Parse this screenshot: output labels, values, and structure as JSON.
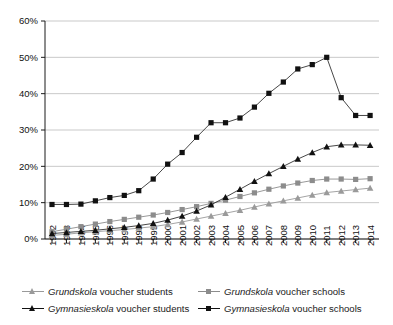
{
  "chart_data": {
    "type": "line",
    "title": "",
    "xlabel": "",
    "ylabel": "",
    "grid": true,
    "legend_position": "bottom",
    "ylim": [
      0,
      60
    ],
    "ytick_step": 10,
    "ytick_labels": [
      "0%",
      "10%",
      "20%",
      "30%",
      "40%",
      "50%",
      "60%"
    ],
    "ytick_values": [
      0,
      10,
      20,
      30,
      40,
      50,
      60
    ],
    "categories": [
      "1992",
      "1993",
      "1994",
      "1995",
      "1996",
      "1997",
      "1998",
      "1999",
      "2000",
      "2001",
      "2002",
      "2003",
      "2004",
      "2005",
      "2006",
      "2007",
      "2008",
      "2009",
      "2010",
      "2011",
      "2012",
      "2013",
      "2014"
    ],
    "series": [
      {
        "name": "Grundskola voucher students",
        "name_italic": "Grundskola",
        "name_rest": " voucher students",
        "marker": "triangle",
        "color": "#9a9a9a",
        "line_color": "#9a9a9a",
        "values": [
          1.0,
          1.3,
          1.7,
          2.0,
          2.3,
          2.6,
          3.0,
          3.4,
          4.0,
          4.7,
          5.5,
          6.3,
          7.1,
          7.9,
          8.8,
          9.7,
          10.5,
          11.3,
          12.1,
          12.8,
          13.2,
          13.6,
          14.0
        ]
      },
      {
        "name": "Grundskola voucher schools",
        "name_italic": "Grundskola",
        "name_rest": " voucher schools",
        "marker": "square",
        "color": "#8c8c8c",
        "line_color": "#8c8c8c",
        "values": [
          2.0,
          2.7,
          3.4,
          4.1,
          4.8,
          5.4,
          6.0,
          6.6,
          7.3,
          8.1,
          8.9,
          9.8,
          10.7,
          11.7,
          12.7,
          13.7,
          14.6,
          15.4,
          16.1,
          16.5,
          16.5,
          16.4,
          16.6
        ]
      },
      {
        "name": "Gymnasieskola voucher students",
        "name_italic": "Gymnasieskola",
        "name_rest": " voucher students",
        "marker": "triangle",
        "color": "#111111",
        "line_color": "#333333",
        "values": [
          1.5,
          1.8,
          2.1,
          2.4,
          2.8,
          3.2,
          3.7,
          4.3,
          5.2,
          6.3,
          7.7,
          9.4,
          11.5,
          13.7,
          15.9,
          18.0,
          20.0,
          22.0,
          23.8,
          25.4,
          25.9,
          25.9,
          25.8
        ]
      },
      {
        "name": "Gymnasieskola voucher schools",
        "name_italic": "Gymnasieskola",
        "name_rest": " voucher schools",
        "marker": "square",
        "color": "#111111",
        "line_color": "#333333",
        "values": [
          9.5,
          9.5,
          9.6,
          10.5,
          11.4,
          12.0,
          13.3,
          16.5,
          20.6,
          23.8,
          28.0,
          32.0,
          32.0,
          33.3,
          36.3,
          40.1,
          43.2,
          46.8,
          48.0,
          50.0,
          38.9,
          34.0,
          34.0
        ]
      }
    ]
  },
  "axis": {
    "y_tick_labels": [
      "60%",
      "50%",
      "40%",
      "30%",
      "20%",
      "10%",
      "0%"
    ],
    "x_tick_labels": [
      "1992",
      "1993",
      "1994",
      "1995",
      "1996",
      "1997",
      "1998",
      "1999",
      "2000",
      "2001",
      "2002",
      "2003",
      "2004",
      "2005",
      "2006",
      "2007",
      "2008",
      "2009",
      "2010",
      "2011",
      "2012",
      "2013",
      "2014"
    ]
  },
  "legend": {
    "items": [
      {
        "label": "Grundskola voucher students",
        "italic_part": "Grundskola",
        "rest_part": " voucher students",
        "marker": "triangle",
        "color": "#9a9a9a"
      },
      {
        "label": "Grundskola voucher schools",
        "italic_part": "Grundskola",
        "rest_part": " voucher schools",
        "marker": "square",
        "color": "#8c8c8c"
      },
      {
        "label": "Gymnasieskola voucher students",
        "italic_part": "Gymnasieskola",
        "rest_part": " voucher students",
        "marker": "triangle",
        "color": "#111111"
      },
      {
        "label": "Gymnasieskola voucher schools",
        "italic_part": "Gymnasieskola",
        "rest_part": " voucher schools",
        "marker": "square",
        "color": "#111111"
      }
    ]
  },
  "colors": {
    "gridline": "#c9c9c9",
    "axis": "#1a1a1a",
    "background": "#ffffff",
    "gray_series": "#9a9a9a",
    "black_series": "#111111"
  }
}
